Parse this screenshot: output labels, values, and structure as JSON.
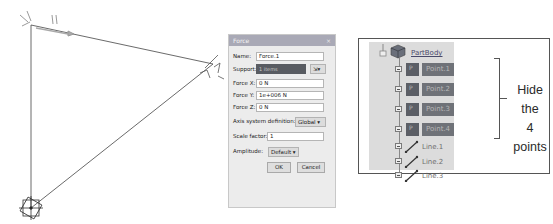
{
  "canvas": {
    "description": "3D wireframe sketch with force arrow and support marks",
    "line_color": "#444444"
  },
  "force_dialog": {
    "title": "Force",
    "close_glyph": "×",
    "name_label": "Name:",
    "name_value": "Force.1",
    "support_label": "Support:",
    "support_value": "1 items",
    "force_x_label": "Force X:",
    "force_x_value": "0 N",
    "force_y_label": "Force Y:",
    "force_y_value": "1e+006 N",
    "force_z_label": "Force Z:",
    "force_z_value": "0 N",
    "axis_label": "Axis system definition:",
    "axis_value": "Global",
    "scale_label": "Scale factor:",
    "scale_value": "1",
    "amplitude_label": "Amplitude:",
    "amplitude_value": "Default",
    "ok_label": "OK",
    "cancel_label": "Cancel"
  },
  "spec_tree": {
    "root_label": "PartBody",
    "points": [
      {
        "label": "Point.1"
      },
      {
        "label": "Point.2"
      },
      {
        "label": "Point.3"
      },
      {
        "label": "Point.4"
      }
    ],
    "lines": [
      {
        "label": "Line.1"
      },
      {
        "label": "Line.2"
      },
      {
        "label": "Line.3"
      }
    ],
    "annotation_line1": "Hide the",
    "annotation_line2": "4 points",
    "colors": {
      "hidden_item_bg": "#6f7278",
      "panel_bg": "#dcdcdc"
    }
  }
}
